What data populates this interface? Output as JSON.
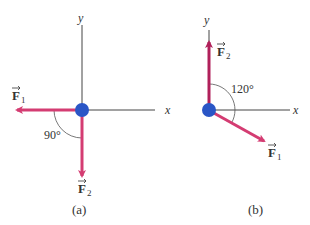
{
  "panels": [
    {
      "id": "a",
      "caption": "(a)",
      "axis_y_label": "y",
      "axis_x_label": "x",
      "angle_label": "90°",
      "forces": [
        {
          "name": "F",
          "subscript": "1",
          "direction": "left (-x)"
        },
        {
          "name": "F",
          "subscript": "2",
          "direction": "down (-y)"
        }
      ]
    },
    {
      "id": "b",
      "caption": "(b)",
      "axis_y_label": "y",
      "axis_x_label": "x",
      "angle_label": "120°",
      "forces": [
        {
          "name": "F",
          "subscript": "1",
          "direction": "down-right, 120° from F2"
        },
        {
          "name": "F",
          "subscript": "2",
          "direction": "up (+y)"
        }
      ]
    }
  ],
  "colors": {
    "force_arrow": "#d43c72",
    "force_arrow_dark": "#b0205a",
    "particle": "#2a56c6",
    "axis": "#444444",
    "arc": "#555555",
    "text": "#333333"
  }
}
